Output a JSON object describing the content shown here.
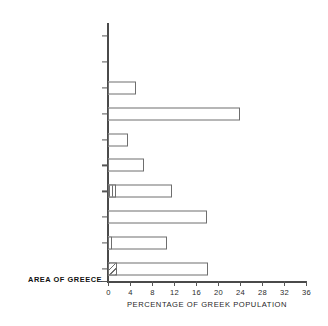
{
  "chart_data": {
    "type": "bar",
    "orientation": "horizontal",
    "title": "",
    "xlabel": "PERCENTAGE OF GREEK POPULATION",
    "ylabel": "AREA OF GREECE",
    "xlim": [
      0,
      36
    ],
    "ylim": null,
    "grid": false,
    "legend": null,
    "xticks": [
      0,
      4,
      8,
      12,
      16,
      20,
      24,
      28,
      32,
      36
    ],
    "xticklabels": [
      "0",
      "4",
      "8",
      "12",
      "16",
      "20",
      "24",
      "28",
      "32",
      "36"
    ],
    "categories": [
      "CYCLADES",
      "CRETE",
      "CENTRAL GREECE",
      "ATTICA",
      "WESTERN GREECE",
      "NORTHEAST AEGEAN",
      "DODECANESE",
      "NOTHERN GREECE",
      "OUTSIDE GREECE",
      "PELOPONNESUS"
    ],
    "values": [
      0,
      0,
      5.1,
      24.0,
      3.6,
      6.5,
      11.6,
      18.0,
      10.7,
      18.2
    ],
    "bars": [
      {
        "category": "CYCLADES",
        "value": 0,
        "fill": "none",
        "segment": null
      },
      {
        "category": "CRETE",
        "value": 0,
        "fill": "none",
        "segment": null
      },
      {
        "category": "CENTRAL GREECE",
        "value": 5.1,
        "fill": "white",
        "segment": null
      },
      {
        "category": "ATTICA",
        "value": 24.0,
        "fill": "white",
        "segment": null
      },
      {
        "category": "WESTERN GREECE",
        "value": 3.6,
        "fill": "white",
        "segment": null
      },
      {
        "category": "NORTHEAST AEGEAN",
        "value": 6.5,
        "fill": "white",
        "segment": null
      },
      {
        "category": "DODECANESE",
        "value": 11.6,
        "fill": "white",
        "segment": {
          "style": "vertical-hatch",
          "value": 1.4
        }
      },
      {
        "category": "NOTHERN GREECE",
        "value": 18.0,
        "fill": "white",
        "segment": null
      },
      {
        "category": "OUTSIDE GREECE",
        "value": 10.7,
        "fill": "white",
        "segment": {
          "style": "plain-box",
          "value": 0.8
        }
      },
      {
        "category": "PELOPONNESUS",
        "value": 18.2,
        "fill": "white",
        "segment": {
          "style": "diagonal-hatch",
          "value": 1.7
        }
      }
    ],
    "colors": {
      "bar_fill": "#ffffff",
      "bar_edge": "#6e6e6e",
      "axis": "#4a4a4a",
      "text": "#1f1f1f",
      "background": "#ffffff"
    }
  }
}
